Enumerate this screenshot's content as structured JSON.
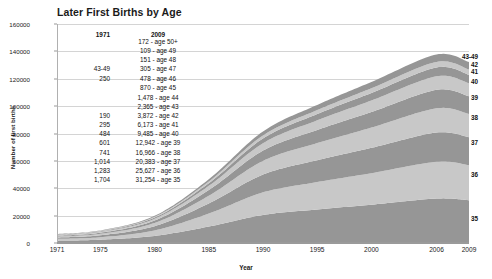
{
  "chart_data": {
    "type": "area",
    "title": "Later First Births by Age",
    "xlabel": "Year",
    "ylabel": "Number of first births",
    "ylim": [
      0,
      160000
    ],
    "ytick_values": [
      0,
      20000,
      40000,
      60000,
      80000,
      100000,
      120000,
      140000,
      160000
    ],
    "ytick_labels": [
      "0",
      "20000",
      "40000",
      "60000",
      "80000",
      "100000",
      "120000",
      "140000",
      "160000"
    ],
    "xlim": [
      1971,
      2009
    ],
    "xtick_values": [
      1971,
      1975,
      1980,
      1985,
      1990,
      1995,
      2000,
      2006,
      2009
    ],
    "xtick_labels": [
      "1971",
      "1975",
      "1980",
      "1985",
      "1990",
      "1995",
      "2000",
      "2006",
      "2009"
    ],
    "grid": "horizontal",
    "legend_position": "right-inline",
    "stacked": true,
    "x": [
      1971,
      1975,
      1980,
      1985,
      1990,
      1995,
      2000,
      2006,
      2009
    ],
    "series": [
      {
        "name": "35",
        "label": "35",
        "color": "#969696",
        "values": [
          1704,
          2400,
          5200,
          12000,
          20500,
          24500,
          28000,
          32500,
          31254
        ]
      },
      {
        "name": "36",
        "label": "36",
        "color": "#c8c8c8",
        "values": [
          1283,
          1800,
          4000,
          9500,
          16500,
          20000,
          23000,
          26800,
          25627
        ]
      },
      {
        "name": "37",
        "label": "37",
        "color": "#969696",
        "values": [
          1014,
          1450,
          3100,
          7400,
          13000,
          16000,
          18500,
          21400,
          20383
        ]
      },
      {
        "name": "38",
        "label": "38",
        "color": "#c8c8c8",
        "values": [
          741,
          1050,
          2350,
          5600,
          10000,
          12500,
          14800,
          17700,
          16966
        ]
      },
      {
        "name": "39",
        "label": "39",
        "color": "#969696",
        "values": [
          601,
          820,
          1750,
          4200,
          7500,
          9600,
          11400,
          13500,
          12942
        ]
      },
      {
        "name": "40",
        "label": "40",
        "color": "#c8c8c8",
        "values": [
          484,
          640,
          1300,
          3050,
          5400,
          7000,
          8400,
          9900,
          9485
        ]
      },
      {
        "name": "41",
        "label": "41",
        "color": "#969696",
        "values": [
          295,
          420,
          860,
          1950,
          3500,
          4600,
          5500,
          6450,
          6173
        ]
      },
      {
        "name": "42",
        "label": "42",
        "color": "#c8c8c8",
        "values": [
          190,
          280,
          560,
          1250,
          2200,
          2900,
          3450,
          4050,
          3872
        ]
      },
      {
        "name": "43-49",
        "label": "43-49",
        "color": "#969696",
        "values": [
          250,
          360,
          720,
          1600,
          2900,
          3800,
          4600,
          5400,
          5450
        ]
      }
    ],
    "totals": [
      6562,
      9220,
      19840,
      46550,
      81500,
      100900,
      117650,
      137700,
      132152
    ],
    "annotations": {
      "col_1971": {
        "header": "1971",
        "rows": [
          {
            "value": "43-49",
            "y": 127000
          },
          {
            "value": "250",
            "y": 120000
          },
          {
            "value": "190",
            "y": 92500
          },
          {
            "value": "295",
            "y": 86500
          },
          {
            "value": "484",
            "y": 79500
          },
          {
            "value": "601",
            "y": 72800
          },
          {
            "value": "741",
            "y": 66000
          },
          {
            "value": "1,014",
            "y": 59200
          },
          {
            "value": "1,283",
            "y": 52500
          },
          {
            "value": "1,704",
            "y": 45800
          }
        ]
      },
      "col_2009": {
        "header": "2009",
        "rows": [
          {
            "value": "172 - age 50+",
            "y": 147200
          },
          {
            "value": "109 - age 49",
            "y": 140500
          },
          {
            "value": "151 - age 48",
            "y": 133800
          },
          {
            "value": "305 - age 47",
            "y": 127000
          },
          {
            "value": "478 - age 46",
            "y": 120000
          },
          {
            "value": "870 - age 45",
            "y": 113000
          },
          {
            "value": "1,478 - age 44",
            "y": 106000
          },
          {
            "value": "2,365 - age 43",
            "y": 99200
          },
          {
            "value": "3,872 - age 42",
            "y": 92500
          },
          {
            "value": "6,173 - age 41",
            "y": 86500
          },
          {
            "value": "9,485 - age 40",
            "y": 79500
          },
          {
            "value": "12,942 - age 39",
            "y": 72800
          },
          {
            "value": "16,966 - age 38",
            "y": 66000
          },
          {
            "value": "20,383 - age 37",
            "y": 59200
          },
          {
            "value": "25,627 - age 36",
            "y": 52500
          },
          {
            "value": "31,254 - age 35",
            "y": 45800
          }
        ]
      }
    },
    "band_labels": [
      {
        "label": "43-49",
        "y_center": 136500
      },
      {
        "label": "42",
        "y_center": 131000
      },
      {
        "label": "41",
        "y_center": 126000
      },
      {
        "label": "40",
        "y_center": 118200
      },
      {
        "label": "39",
        "y_center": 107000
      },
      {
        "label": "38",
        "y_center": 92200
      },
      {
        "label": "37",
        "y_center": 73600
      },
      {
        "label": "36",
        "y_center": 50200
      },
      {
        "label": "35",
        "y_center": 18000
      }
    ]
  }
}
